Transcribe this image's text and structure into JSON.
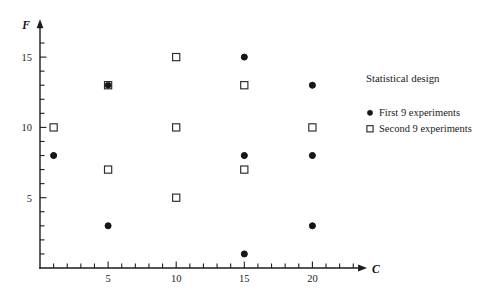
{
  "chart_data": {
    "type": "scatter",
    "title": "",
    "xlabel": "C",
    "ylabel": "F",
    "xlim": [
      0,
      23.5
    ],
    "ylim": [
      0,
      17.2
    ],
    "grid": false,
    "xticks_major": [
      5,
      10,
      15,
      20
    ],
    "xtick_labels": [
      "5",
      "10",
      "15",
      "20"
    ],
    "xticks_minor_step": 1,
    "yticks_major": [
      5,
      10,
      15
    ],
    "ytick_labels": [
      "5",
      "10",
      "15"
    ],
    "yticks_minor_step": 1,
    "legend_position": "right",
    "series": [
      {
        "name": "First 9 experiments",
        "marker": "filled-circle",
        "color": "#171717",
        "points": [
          {
            "x": 1,
            "y": 8
          },
          {
            "x": 5,
            "y": 13
          },
          {
            "x": 5,
            "y": 3
          },
          {
            "x": 15,
            "y": 15
          },
          {
            "x": 15,
            "y": 8
          },
          {
            "x": 15,
            "y": 1
          },
          {
            "x": 20,
            "y": 13
          },
          {
            "x": 20,
            "y": 8
          },
          {
            "x": 20,
            "y": 3
          }
        ]
      },
      {
        "name": "Second 9 experiments",
        "marker": "open-square",
        "color": "#2a2a2a",
        "points": [
          {
            "x": 1,
            "y": 10
          },
          {
            "x": 5,
            "y": 13
          },
          {
            "x": 5,
            "y": 7
          },
          {
            "x": 10,
            "y": 15
          },
          {
            "x": 10,
            "y": 10
          },
          {
            "x": 10,
            "y": 5
          },
          {
            "x": 15,
            "y": 13
          },
          {
            "x": 15,
            "y": 7
          },
          {
            "x": 20,
            "y": 10
          }
        ]
      }
    ]
  },
  "axes": {
    "y_label": "F",
    "x_label": "C"
  },
  "legend": {
    "title": "Statistical design",
    "entries": [
      {
        "label": "First 9 experiments",
        "marker": "filled-circle"
      },
      {
        "label": "Second 9 experiments",
        "marker": "open-square"
      }
    ]
  }
}
